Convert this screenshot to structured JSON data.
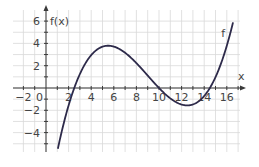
{
  "chart_data": {
    "type": "line",
    "title": "",
    "xlabel": "x",
    "ylabel": "f(x)",
    "curve_label": "f",
    "xlim": [
      -3,
      17
    ],
    "ylim": [
      -6.5,
      7
    ],
    "x_ticks": [
      -2,
      0,
      2,
      4,
      6,
      8,
      10,
      12,
      14,
      16
    ],
    "y_ticks": [
      -4,
      -2,
      2,
      4,
      6
    ],
    "grid": true,
    "legend": "none",
    "series": [
      {
        "name": "f",
        "color": "#2d2a4a",
        "description": "cubic with zeros near x=2.5, x=10, x=14.5; local max ≈ (5.6, 3.75); local min ≈ (12.4, -1.9)",
        "x": [
          1.1,
          2,
          2.5,
          3,
          4,
          5,
          5.6,
          6,
          7,
          8,
          9,
          10,
          11,
          12,
          12.4,
          13,
          14,
          14.5,
          15,
          16,
          16.5
        ],
        "y": [
          -5.5,
          -1.9,
          0,
          1.5,
          3.2,
          3.7,
          3.75,
          3.6,
          3.0,
          2.0,
          0.9,
          0,
          -1.0,
          -1.8,
          -1.9,
          -1.7,
          -0.9,
          0,
          0.9,
          3.9,
          6.8
        ]
      }
    ]
  },
  "labels": {
    "y_axis": "f(x)",
    "x_axis": "x",
    "curve": "f",
    "origin": "0",
    "x_ticks": [
      "-2",
      "2",
      "4",
      "6",
      "8",
      "10",
      "12",
      "14",
      "16"
    ],
    "y_ticks": [
      "6",
      "4",
      "2",
      "-2",
      "-4"
    ]
  }
}
